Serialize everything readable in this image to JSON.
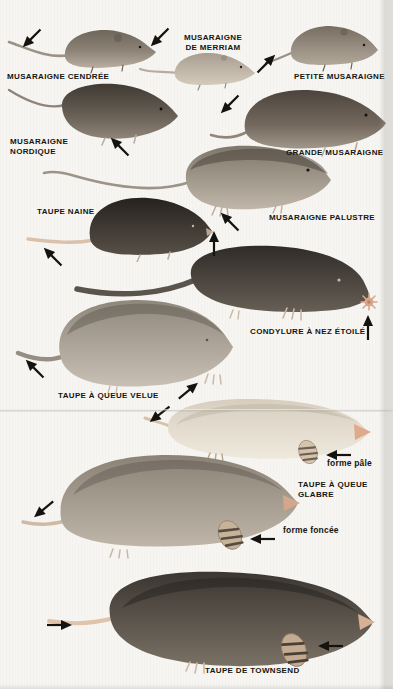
{
  "figure": {
    "description_colors": {
      "paper": "#f6f5f2",
      "ink": "#17150f",
      "crease": "#969189",
      "shrew_gray_brown": "#6e665b",
      "pale_shrew": "#a79e91",
      "dark_shrew": "#403a33",
      "black_mole": "#26221e",
      "condylure_dark": "#2f2b27",
      "pale_mole_cream": "#dcd4c5",
      "pink_flesh": "#dfa98d"
    },
    "species": [
      {
        "id": "musaraigne-cendree",
        "label": "MUSARAIGNE CENDRÉE"
      },
      {
        "id": "musaraigne-de-merriam",
        "label_line1": "MUSARAIGNE",
        "label_line2": "DE MERRIAM"
      },
      {
        "id": "petite-musaraigne",
        "label": "PETITE MUSARAIGNE"
      },
      {
        "id": "musaraigne-nordique",
        "label_line1": "MUSARAIGNE",
        "label_line2": "NORDIQUE"
      },
      {
        "id": "grande-musaraigne",
        "label": "GRANDE MUSARAIGNE"
      },
      {
        "id": "taupe-naine",
        "label": "TAUPE NAINE"
      },
      {
        "id": "musaraigne-palustre",
        "label": "MUSARAIGNE PALUSTRE"
      },
      {
        "id": "condylure-a-nez-etoile",
        "label": "CONDYLURE À NEZ ÉTOILÉ"
      },
      {
        "id": "taupe-a-queue-velue",
        "label": "TAUPE À QUEUE VELUE"
      },
      {
        "id": "taupe-a-queue-glabre",
        "label_line1": "TAUPE À QUEUE",
        "label_line2": "GLABRE",
        "forms": [
          {
            "label": "forme pâle"
          },
          {
            "label": "forme foncée"
          }
        ]
      },
      {
        "id": "taupe-de-townsend",
        "label": "TAUPE DE TOWNSEND"
      }
    ]
  }
}
